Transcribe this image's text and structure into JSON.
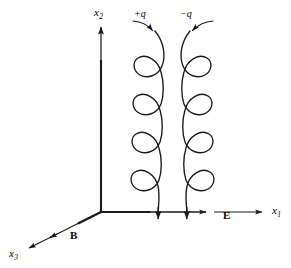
{
  "figure": {
    "background_color": "#ffffff",
    "stroke_color": "#1a1a1a",
    "width": 291,
    "height": 268
  },
  "axes": {
    "origin": {
      "x": 101,
      "y": 212
    },
    "items": [
      {
        "name": "x1",
        "label": "x",
        "subscript": "1",
        "label_x": 272,
        "label_y": 206,
        "direction": "right",
        "from": {
          "x": 101,
          "y": 212
        },
        "to": {
          "x": 266,
          "y": 212
        }
      },
      {
        "name": "x2",
        "label": "x",
        "subscript": "2",
        "label_x": 94,
        "label_y": 8,
        "direction": "up",
        "from": {
          "x": 101,
          "y": 212
        },
        "to": {
          "x": 101,
          "y": 22
        }
      },
      {
        "name": "x3",
        "label": "x",
        "subscript": "3",
        "label_x": 10,
        "label_y": 249,
        "direction": "down-left",
        "from": {
          "x": 101,
          "y": 212
        },
        "to": {
          "x": 26,
          "y": 250
        }
      }
    ]
  },
  "field_labels": [
    {
      "name": "electric-field",
      "label": "E",
      "x": 223,
      "y": 210,
      "axis": "x1",
      "arrow_tip": {
        "x": 214,
        "y": 212
      }
    },
    {
      "name": "magnetic-field",
      "label": "B",
      "x": 70,
      "y": 230,
      "axis": "x3",
      "arrow_tip": {
        "x": 57,
        "y": 234
      }
    }
  ],
  "trajectories": [
    {
      "name": "positive-charge-trajectory",
      "charge_label": "+q",
      "label_x": 134,
      "label_y": 10,
      "loop_side": "left",
      "loop_count": 4,
      "center_x": 158,
      "top_y": 30,
      "bottom_y": 212,
      "arrow_end": {
        "x": 158,
        "y": 224
      },
      "entry_arrow": {
        "from_x": 134,
        "from_y": 22,
        "to_x": 153,
        "to_y": 34
      }
    },
    {
      "name": "negative-charge-trajectory",
      "charge_label": "−q",
      "label_x": 180,
      "label_y": 10,
      "loop_side": "right",
      "loop_count": 4,
      "center_x": 187,
      "top_y": 30,
      "bottom_y": 212,
      "arrow_end": {
        "x": 187,
        "y": 224
      },
      "entry_arrow": {
        "from_x": 212,
        "from_y": 22,
        "to_x": 192,
        "to_y": 34
      }
    }
  ]
}
